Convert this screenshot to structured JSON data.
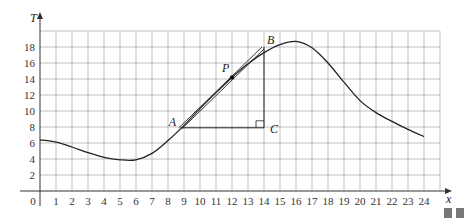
{
  "chart_data": {
    "type": "line",
    "title": "",
    "xlabel": "x",
    "ylabel": "T",
    "xlim": [
      0,
      25
    ],
    "ylim": [
      0,
      20
    ],
    "grid": true,
    "x_ticks": [
      0,
      1,
      2,
      3,
      4,
      5,
      6,
      7,
      8,
      9,
      10,
      11,
      12,
      13,
      14,
      15,
      16,
      17,
      18,
      19,
      20,
      21,
      22,
      23,
      24
    ],
    "y_ticks": [
      2,
      4,
      6,
      8,
      10,
      12,
      14,
      16,
      18
    ],
    "origin_label": "0",
    "series": [
      {
        "name": "T(x)",
        "x": [
          0,
          1,
          2,
          3,
          4,
          5,
          6,
          7,
          8,
          9,
          10,
          11,
          12,
          13,
          14,
          15,
          16,
          17,
          18,
          19,
          20,
          21,
          22,
          23,
          24
        ],
        "values": [
          6.4,
          6.1,
          5.5,
          4.8,
          4.2,
          3.9,
          3.9,
          4.7,
          6.3,
          8.2,
          10.3,
          12.3,
          14.2,
          15.9,
          17.3,
          18.3,
          18.7,
          17.9,
          16.0,
          13.6,
          11.3,
          9.8,
          8.7,
          7.7,
          6.8
        ]
      }
    ],
    "annotations": {
      "point_P": {
        "label": "P",
        "x": 12,
        "y": 14.2
      },
      "point_A": {
        "label": "A",
        "x": 8.8,
        "y": 7.9
      },
      "point_B": {
        "label": "B",
        "x": 14,
        "y": 18
      },
      "point_C": {
        "label": "C",
        "x": 14,
        "y": 7.9
      },
      "tangent_line": "A to B through P",
      "right_angle_at": "C"
    }
  }
}
